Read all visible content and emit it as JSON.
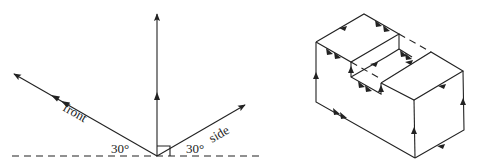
{
  "left_diagram": {
    "labels": {
      "front": "front",
      "side": "side",
      "angle_left": "30°",
      "angle_right": "30°"
    },
    "axes": [
      {
        "name": "front",
        "angle_deg": 150,
        "arrow_count": 2
      },
      {
        "name": "vertical",
        "angle_deg": 90,
        "arrow_count": 1
      },
      {
        "name": "side",
        "angle_deg": 30,
        "arrow_count": 1
      }
    ],
    "right_angle_marker": true
  },
  "right_diagram": {
    "description": "isometric block with rectangular notch, edges marked with direction arrows"
  }
}
